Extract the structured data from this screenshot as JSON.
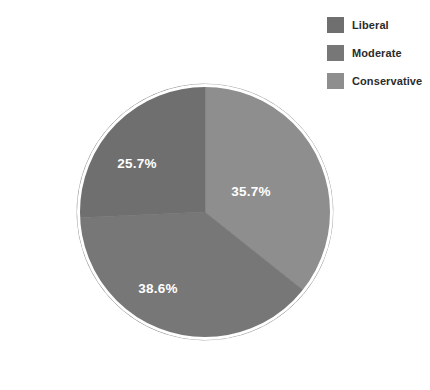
{
  "chart_data": {
    "type": "pie",
    "title": "",
    "subtitle": "",
    "categories": [
      "Liberal",
      "Moderate",
      "Conservative"
    ],
    "values": [
      25.7,
      38.6,
      35.7
    ],
    "value_unit": "%",
    "data_labels": [
      "25.7%",
      "38.6%",
      "35.7%"
    ],
    "colors": [
      "#6f6f6f",
      "#777777",
      "#8e8e8e"
    ],
    "legend": {
      "position": "top-right",
      "entries": [
        {
          "label": "Liberal",
          "color": "#6f6f6f",
          "value": 25.7,
          "data_label": "25.7%"
        },
        {
          "label": "Moderate",
          "color": "#777777",
          "value": 38.6,
          "data_label": "38.6%"
        },
        {
          "label": "Conservative",
          "color": "#8e8e8e",
          "value": 35.7,
          "data_label": "35.7%"
        }
      ]
    },
    "start_angle_deg": 0,
    "direction": "clockwise",
    "slice_order_from_twelve_oclock": [
      "Conservative",
      "Moderate",
      "Liberal"
    ],
    "label_color": "#ffffff",
    "outline_color": "#ffffff",
    "background": "#ffffff",
    "grid": false,
    "xlabel": "",
    "ylabel": ""
  },
  "pie": {
    "center_x": 205,
    "center_y": 212,
    "radius": 128,
    "slices": [
      {
        "name": "conservative",
        "label": "35.7%",
        "color": "#8e8e8e",
        "start_deg": 0,
        "end_deg": 128.52,
        "label_x": 251,
        "label_y": 192
      },
      {
        "name": "moderate",
        "label": "38.6%",
        "color": "#777777",
        "start_deg": 128.52,
        "end_deg": 267.48,
        "label_x": 158,
        "label_y": 289
      },
      {
        "name": "liberal",
        "label": "25.7%",
        "color": "#6f6f6f",
        "start_deg": 267.48,
        "end_deg": 360,
        "label_x": 137,
        "label_y": 164
      }
    ]
  }
}
